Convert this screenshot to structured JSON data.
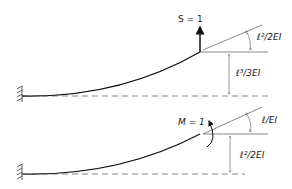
{
  "diagram": {
    "case_1": {
      "load_label": "S = 1",
      "rotation_label": "ℓ²/2EI",
      "deflection_label": "ℓ³/3EI"
    },
    "case_2": {
      "load_label": "M = 1",
      "rotation_label": "ℓ/EI",
      "deflection_label": "ℓ²/2EI"
    },
    "colors": {
      "line": "#222222",
      "dim": "#555555"
    }
  }
}
